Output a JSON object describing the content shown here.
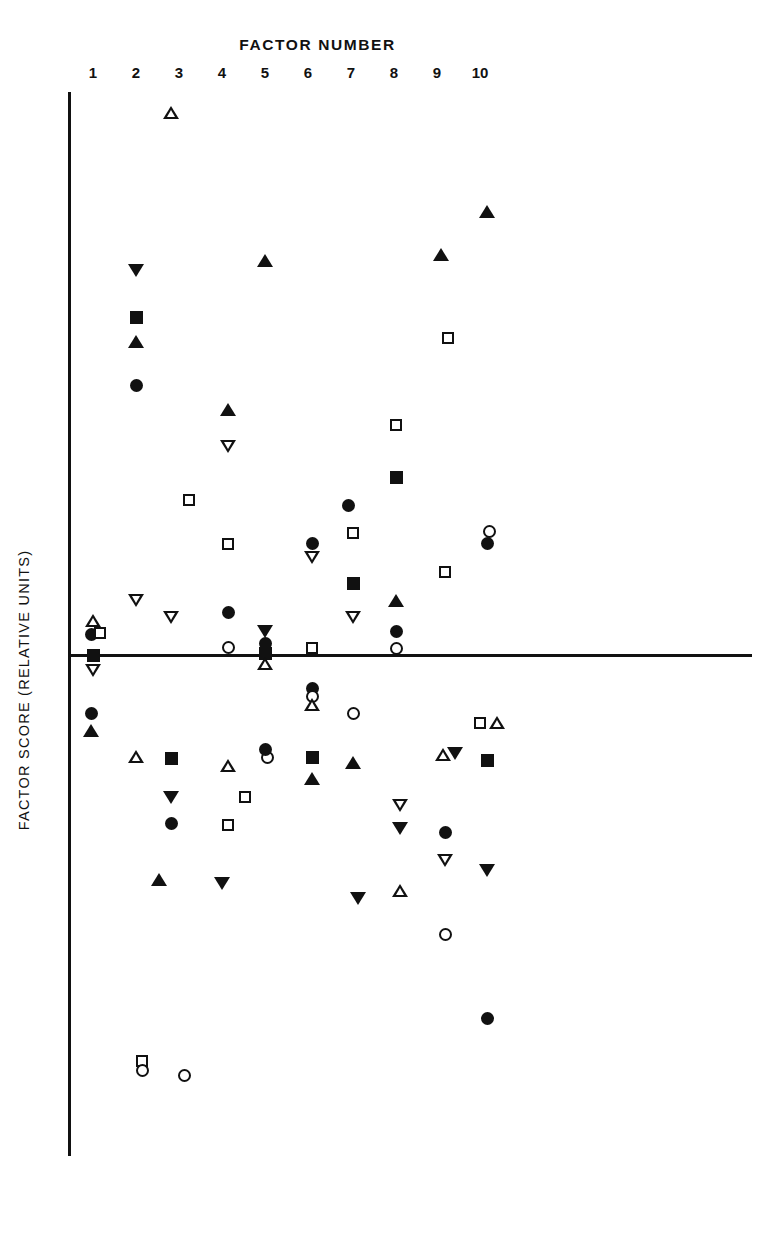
{
  "chart_data": {
    "type": "scatter",
    "title": "FACTOR NUMBER",
    "xlabel": "FACTOR NUMBER",
    "ylabel": "FACTOR SCORE (RELATIVE UNITS)",
    "xtick_labels": [
      "1",
      "2",
      "3",
      "4",
      "5",
      "6",
      "7",
      "8",
      "9",
      "10"
    ],
    "grid": false,
    "legend": "none",
    "zero_line": true,
    "y_axis_ticks_shown": false,
    "axis_color": "#111111",
    "marker_color": "#111111",
    "background": "#ffffff",
    "note": "Y values are in relative units estimated from pixel offsets about the zero line; positive above, negative below.",
    "series": [
      {
        "name": "open-triangle-up",
        "marker": "triangle-up-open",
        "points": [
          {
            "factor": 3,
            "y": 2.87
          },
          {
            "factor": 1,
            "y": 0.21
          },
          {
            "factor": 5,
            "y": -0.04
          },
          {
            "factor": 2,
            "y": -0.56
          },
          {
            "factor": 6,
            "y": -0.28
          },
          {
            "factor": 4,
            "y": -0.64
          },
          {
            "factor": 7,
            "y": -0.62
          },
          {
            "factor": 8,
            "y": -0.99
          },
          {
            "factor": 9,
            "y": -0.53
          },
          {
            "factor": 10,
            "y": -0.37
          }
        ]
      },
      {
        "name": "filled-triangle-up",
        "marker": "triangle-up-filled",
        "points": [
          {
            "factor": 10,
            "y": 1.84
          },
          {
            "factor": 9,
            "y": 1.59
          },
          {
            "factor": 5,
            "y": 1.54
          },
          {
            "factor": 2,
            "y": 1.24
          },
          {
            "factor": 4,
            "y": 0.92
          },
          {
            "factor": 8,
            "y": 0.27
          },
          {
            "factor": 1,
            "y": -0.34
          },
          {
            "factor": 7,
            "y": -0.55
          },
          {
            "factor": 6,
            "y": -0.71
          },
          {
            "factor": 3,
            "y": -1.07
          }
        ]
      },
      {
        "name": "open-triangle-down",
        "marker": "triangle-down-open",
        "points": [
          {
            "factor": 4,
            "y": 0.77
          },
          {
            "factor": 2,
            "y": 0.21
          },
          {
            "factor": 3,
            "y": 0.14
          },
          {
            "factor": 6,
            "y": 0.38
          },
          {
            "factor": 7,
            "y": 0.15
          },
          {
            "factor": 1,
            "y": -0.06
          },
          {
            "factor": 8,
            "y": -0.73
          },
          {
            "factor": 9,
            "y": -0.82
          }
        ]
      },
      {
        "name": "filled-triangle-down",
        "marker": "triangle-down-filled",
        "points": [
          {
            "factor": 2,
            "y": 1.48
          },
          {
            "factor": 5,
            "y": 0.09
          },
          {
            "factor": 3,
            "y": -0.63
          },
          {
            "factor": 8,
            "y": -0.79
          },
          {
            "factor": 9,
            "y": -0.43
          },
          {
            "factor": 4,
            "y": -1.07
          },
          {
            "factor": 7,
            "y": -1.1
          },
          {
            "factor": 10,
            "y": -0.97
          }
        ]
      },
      {
        "name": "open-square",
        "marker": "square-open",
        "points": [
          {
            "factor": 9,
            "y": 1.42
          },
          {
            "factor": 8,
            "y": 1.03
          },
          {
            "factor": 3,
            "y": 0.7
          },
          {
            "factor": 7,
            "y": 0.54
          },
          {
            "factor": 4,
            "y": 0.49
          },
          {
            "factor": 10,
            "y": 0.53
          },
          {
            "factor": 9,
            "y": 0.38
          },
          {
            "factor": 1,
            "y": 0.1
          },
          {
            "factor": 6,
            "y": 0.03
          },
          {
            "factor": 5,
            "y": -0.36
          },
          {
            "factor": 4,
            "y": -0.62
          },
          {
            "factor": 10,
            "y": -0.37
          }
        ]
      },
      {
        "name": "filled-square",
        "marker": "square-filled",
        "points": [
          {
            "factor": 2,
            "y": 1.36
          },
          {
            "factor": 8,
            "y": 0.76
          },
          {
            "factor": 7,
            "y": 0.36
          },
          {
            "factor": 5,
            "y": 0.01
          },
          {
            "factor": 1,
            "y": 0.0
          },
          {
            "factor": 3,
            "y": -0.42
          },
          {
            "factor": 6,
            "y": -0.49
          },
          {
            "factor": 10,
            "y": -0.44
          }
        ]
      },
      {
        "name": "open-circle",
        "marker": "circle-open",
        "points": [
          {
            "factor": 10,
            "y": 0.5
          },
          {
            "factor": 4,
            "y": 0.04
          },
          {
            "factor": 8,
            "y": 0.07
          },
          {
            "factor": 6,
            "y": -0.19
          },
          {
            "factor": 7,
            "y": -0.25
          },
          {
            "factor": 5,
            "y": -0.42
          },
          {
            "factor": 9,
            "y": -1.0
          }
        ]
      },
      {
        "name": "filled-circle",
        "marker": "circle-filled",
        "points": [
          {
            "factor": 2,
            "y": 1.07
          },
          {
            "factor": 7,
            "y": 0.61
          },
          {
            "factor": 6,
            "y": 0.51
          },
          {
            "factor": 9,
            "y": 0.5
          },
          {
            "factor": 4,
            "y": 0.22
          },
          {
            "factor": 8,
            "y": 0.14
          },
          {
            "factor": 5,
            "y": 0.05
          },
          {
            "factor": 1,
            "y": 0.08
          },
          {
            "factor": 6,
            "y": -0.16
          },
          {
            "factor": 1,
            "y": -0.27
          },
          {
            "factor": 3,
            "y": -0.8
          },
          {
            "factor": 9,
            "y": -0.87
          },
          {
            "factor": 10,
            "y": -1.47
          }
        ]
      }
    ],
    "markers_px": [
      {
        "x": 171,
        "y": 113,
        "type": "triangle-up-open"
      },
      {
        "x": 487,
        "y": 212,
        "type": "triangle-up-filled"
      },
      {
        "x": 441,
        "y": 255,
        "type": "triangle-up-filled"
      },
      {
        "x": 265,
        "y": 261,
        "type": "triangle-up-filled"
      },
      {
        "x": 136,
        "y": 270,
        "type": "triangle-down-filled"
      },
      {
        "x": 136,
        "y": 317,
        "type": "square-filled"
      },
      {
        "x": 136,
        "y": 342,
        "type": "triangle-up-filled"
      },
      {
        "x": 448,
        "y": 338,
        "type": "square-open"
      },
      {
        "x": 136,
        "y": 385,
        "type": "circle-filled"
      },
      {
        "x": 228,
        "y": 410,
        "type": "triangle-up-filled"
      },
      {
        "x": 396,
        "y": 425,
        "type": "square-open"
      },
      {
        "x": 228,
        "y": 446,
        "type": "triangle-down-open"
      },
      {
        "x": 396,
        "y": 477,
        "type": "square-filled"
      },
      {
        "x": 189,
        "y": 500,
        "type": "square-open"
      },
      {
        "x": 348,
        "y": 505,
        "type": "circle-filled"
      },
      {
        "x": 353,
        "y": 533,
        "type": "square-open"
      },
      {
        "x": 228,
        "y": 544,
        "type": "square-open"
      },
      {
        "x": 312,
        "y": 543,
        "type": "circle-filled"
      },
      {
        "x": 489,
        "y": 531,
        "type": "circle-open"
      },
      {
        "x": 487,
        "y": 543,
        "type": "circle-filled"
      },
      {
        "x": 312,
        "y": 557,
        "type": "triangle-down-open"
      },
      {
        "x": 445,
        "y": 572,
        "type": "square-open"
      },
      {
        "x": 353,
        "y": 583,
        "type": "square-filled"
      },
      {
        "x": 136,
        "y": 600,
        "type": "triangle-down-open"
      },
      {
        "x": 228,
        "y": 612,
        "type": "circle-filled"
      },
      {
        "x": 396,
        "y": 601,
        "type": "triangle-up-filled"
      },
      {
        "x": 353,
        "y": 617,
        "type": "triangle-down-open"
      },
      {
        "x": 171,
        "y": 617,
        "type": "triangle-down-open"
      },
      {
        "x": 93,
        "y": 621,
        "type": "triangle-up-open"
      },
      {
        "x": 396,
        "y": 631,
        "type": "circle-filled"
      },
      {
        "x": 265,
        "y": 631,
        "type": "triangle-down-filled"
      },
      {
        "x": 265,
        "y": 643,
        "type": "circle-filled"
      },
      {
        "x": 91,
        "y": 634,
        "type": "circle-filled"
      },
      {
        "x": 100,
        "y": 633,
        "type": "square-open"
      },
      {
        "x": 228,
        "y": 647,
        "type": "circle-open"
      },
      {
        "x": 312,
        "y": 648,
        "type": "square-open"
      },
      {
        "x": 265,
        "y": 653,
        "type": "square-filled"
      },
      {
        "x": 396,
        "y": 648,
        "type": "circle-open"
      },
      {
        "x": 93,
        "y": 655,
        "type": "square-filled"
      },
      {
        "x": 265,
        "y": 664,
        "type": "triangle-up-open"
      },
      {
        "x": 93,
        "y": 670,
        "type": "triangle-down-open"
      },
      {
        "x": 312,
        "y": 688,
        "type": "circle-filled"
      },
      {
        "x": 312,
        "y": 696,
        "type": "circle-open"
      },
      {
        "x": 353,
        "y": 713,
        "type": "circle-open"
      },
      {
        "x": 312,
        "y": 705,
        "type": "triangle-up-open"
      },
      {
        "x": 480,
        "y": 723,
        "type": "square-open"
      },
      {
        "x": 497,
        "y": 723,
        "type": "triangle-up-open"
      },
      {
        "x": 91,
        "y": 713,
        "type": "circle-filled"
      },
      {
        "x": 91,
        "y": 731,
        "type": "triangle-up-filled"
      },
      {
        "x": 136,
        "y": 757,
        "type": "triangle-up-open"
      },
      {
        "x": 171,
        "y": 758,
        "type": "square-filled"
      },
      {
        "x": 312,
        "y": 757,
        "type": "square-filled"
      },
      {
        "x": 267,
        "y": 757,
        "type": "circle-open"
      },
      {
        "x": 265,
        "y": 749,
        "type": "circle-filled"
      },
      {
        "x": 487,
        "y": 760,
        "type": "square-filled"
      },
      {
        "x": 443,
        "y": 755,
        "type": "triangle-up-open"
      },
      {
        "x": 455,
        "y": 753,
        "type": "triangle-down-filled"
      },
      {
        "x": 228,
        "y": 766,
        "type": "triangle-up-open"
      },
      {
        "x": 353,
        "y": 763,
        "type": "triangle-up-filled"
      },
      {
        "x": 171,
        "y": 797,
        "type": "triangle-down-filled"
      },
      {
        "x": 312,
        "y": 779,
        "type": "triangle-up-filled"
      },
      {
        "x": 171,
        "y": 823,
        "type": "circle-filled"
      },
      {
        "x": 245,
        "y": 797,
        "type": "square-open"
      },
      {
        "x": 400,
        "y": 805,
        "type": "triangle-down-open"
      },
      {
        "x": 445,
        "y": 832,
        "type": "circle-filled"
      },
      {
        "x": 228,
        "y": 825,
        "type": "square-open"
      },
      {
        "x": 400,
        "y": 828,
        "type": "triangle-down-filled"
      },
      {
        "x": 445,
        "y": 860,
        "type": "triangle-down-open"
      },
      {
        "x": 487,
        "y": 870,
        "type": "triangle-down-filled"
      },
      {
        "x": 159,
        "y": 880,
        "type": "triangle-up-filled"
      },
      {
        "x": 222,
        "y": 883,
        "type": "triangle-down-filled"
      },
      {
        "x": 358,
        "y": 898,
        "type": "triangle-down-filled"
      },
      {
        "x": 400,
        "y": 891,
        "type": "triangle-up-open"
      },
      {
        "x": 445,
        "y": 934,
        "type": "circle-open"
      },
      {
        "x": 487,
        "y": 1018,
        "type": "circle-filled"
      },
      {
        "x": 142,
        "y": 1061,
        "type": "square-open"
      },
      {
        "x": 142,
        "y": 1070,
        "type": "circle-open"
      },
      {
        "x": 184,
        "y": 1075,
        "type": "circle-open"
      }
    ]
  },
  "axes": {
    "x_origin_px": 68,
    "zero_y_px": 655,
    "x_spacing_px": 43,
    "x_first_px": 93
  }
}
